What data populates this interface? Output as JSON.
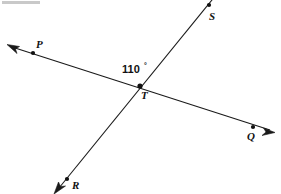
{
  "figure": {
    "type": "geometry-diagram",
    "width": 281,
    "height": 194,
    "background_color": "#ffffff",
    "line_color": "#1a1a1a",
    "text_color": "#111111"
  },
  "angle": {
    "value": "110",
    "degree_symbol": "°",
    "full_label": "110°",
    "position": {
      "x": 122,
      "y": 73
    }
  },
  "points": [
    {
      "id": "P",
      "label": "P",
      "dot": {
        "x": 33,
        "y": 53
      },
      "label_pos": {
        "x": 36,
        "y": 48
      }
    },
    {
      "id": "Q",
      "label": "Q",
      "dot": {
        "x": 253,
        "y": 127
      },
      "label_pos": {
        "x": 247,
        "y": 140
      }
    },
    {
      "id": "R",
      "label": "R",
      "dot": {
        "x": 67,
        "y": 179
      },
      "label_pos": {
        "x": 72,
        "y": 189
      }
    },
    {
      "id": "S",
      "label": "S",
      "dot": {
        "x": 209,
        "y": 5
      },
      "label_pos": {
        "x": 209,
        "y": 20
      }
    },
    {
      "id": "T",
      "label": "T",
      "dot": {
        "x": 140,
        "y": 86
      },
      "label_pos": {
        "x": 141,
        "y": 99
      }
    }
  ],
  "lines": [
    {
      "id": "PQ",
      "name": "line-pq",
      "from_label": "P",
      "to_label": "Q",
      "start": {
        "x": 10,
        "y": 46
      },
      "end": {
        "x": 272,
        "y": 131
      },
      "arrow_start": true,
      "arrow_end": true
    },
    {
      "id": "RS",
      "name": "line-rs",
      "from_label": "R",
      "to_label": "S",
      "start": {
        "x": 56,
        "y": 192
      },
      "end": {
        "x": 216,
        "y": -6
      },
      "arrow_start": true,
      "arrow_end": false
    }
  ],
  "artifact": {
    "name": "top-left-scan-artifact",
    "x": 2,
    "y": 1,
    "width": 38,
    "height": 3,
    "color": "#c9c9c9"
  }
}
